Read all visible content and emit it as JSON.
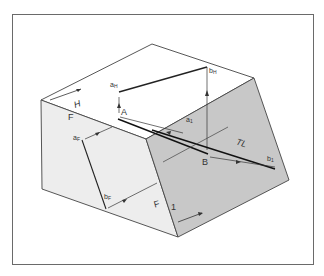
{
  "figure": {
    "title": "",
    "colors": {
      "frame": "#6a6a6a",
      "top_face": "#ffffff",
      "front_face": "#ededed",
      "inclined_face": "#c8c8c8",
      "edges": "#444444",
      "line_ab": "#222222"
    },
    "labels": {
      "plane_h": "H",
      "plane_f_top": "F",
      "plane_f_bottom": "F",
      "plane_1": "1",
      "point_a": "A",
      "point_b": "B",
      "a_h": "a",
      "a_h_sub": "H",
      "b_h": "b",
      "b_h_sub": "H",
      "a_f": "a",
      "a_f_sub": "F",
      "b_f": "b",
      "b_f_sub": "F",
      "a_1": "a",
      "a_1_sub": "1",
      "b_1": "b",
      "b_1_sub": "1",
      "true_length": "TL"
    }
  }
}
